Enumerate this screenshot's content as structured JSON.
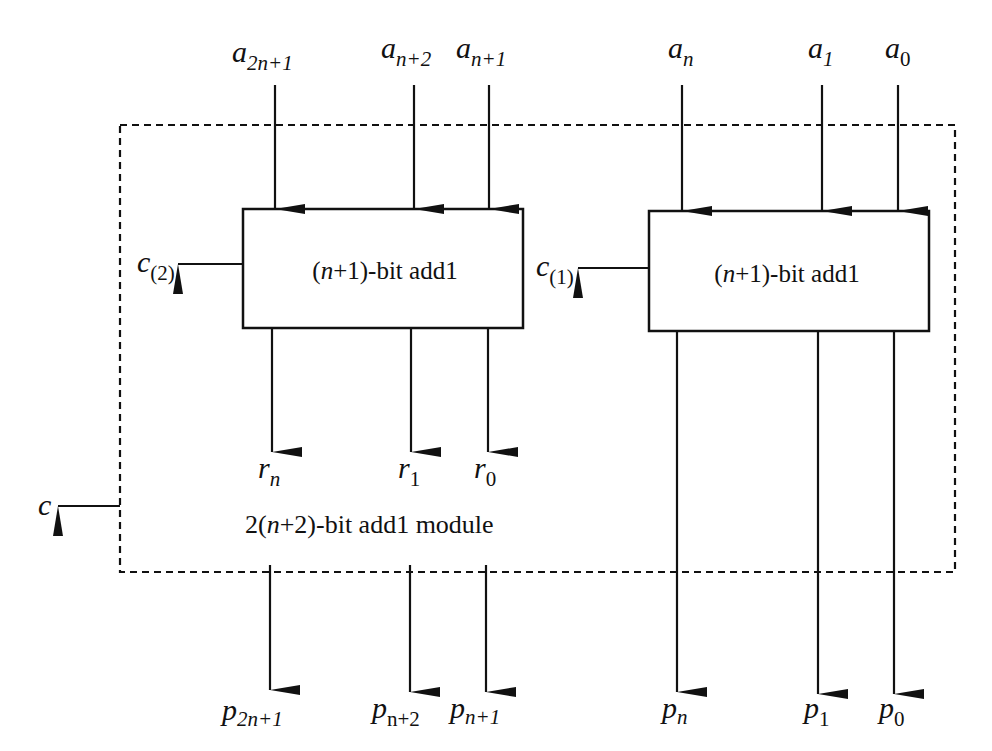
{
  "diagram": {
    "module_label": "2(n+2)-bit add1 module",
    "module_label_parts": {
      "pre": "2(",
      "var": "n",
      "post": "+2)-bit add1 module"
    },
    "blocks": [
      {
        "id": "left",
        "label_pre": "(",
        "label_var": "n",
        "label_post": "+1)-bit add1",
        "carry_base": "c",
        "carry_sub": "(2)"
      },
      {
        "id": "right",
        "label_pre": "(",
        "label_var": "n",
        "label_post": "+1)-bit add1",
        "carry_base": "c",
        "carry_sub": "(1)"
      }
    ],
    "inputs": [
      {
        "base": "a",
        "sub": "2n+1"
      },
      {
        "base": "a",
        "sub": "n+2"
      },
      {
        "base": "a",
        "sub": "n+1"
      },
      {
        "base": "a",
        "sub": "n"
      },
      {
        "base": "a",
        "sub": "1"
      },
      {
        "base": "a",
        "sub": "0"
      }
    ],
    "intermediate_outputs": [
      {
        "base": "r",
        "sub": "n"
      },
      {
        "base": "r",
        "sub": "1"
      },
      {
        "base": "r",
        "sub": "0"
      }
    ],
    "outputs": [
      {
        "base": "p",
        "sub": "2n+1"
      },
      {
        "base": "p",
        "sub": "n+2"
      },
      {
        "base": "p",
        "sub": "n+1"
      },
      {
        "base": "p",
        "sub": "n"
      },
      {
        "base": "p",
        "sub": "1"
      },
      {
        "base": "p",
        "sub": "0"
      }
    ],
    "carry_out": {
      "base": "c"
    }
  }
}
